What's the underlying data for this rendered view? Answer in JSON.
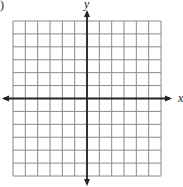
{
  "problem": {
    "partial_label": ")"
  },
  "chart_data": {
    "type": "grid",
    "title": "",
    "xlabel": "x",
    "ylabel": "y",
    "grid": true,
    "columns": 12,
    "rows": 12,
    "xlim": [
      -6,
      6
    ],
    "ylim": [
      -6,
      6
    ],
    "tick_labels": [],
    "data": []
  },
  "layout": {
    "grid_left": 13,
    "grid_top": 21,
    "grid_right": 161,
    "grid_bottom": 176,
    "origin_x": 87,
    "origin_y": 98,
    "grid_color": "#8a8a8a",
    "axis_color": "#222222"
  },
  "axes": {
    "x_label": "x",
    "y_label": "y"
  }
}
